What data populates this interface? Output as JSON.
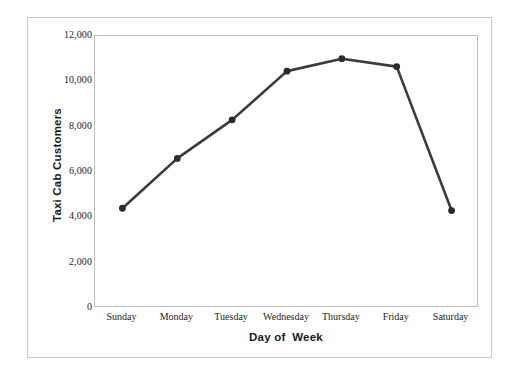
{
  "chart_data": {
    "type": "line",
    "title": "",
    "xlabel": "Day of  Week",
    "ylabel": "Taxi Cab Customers",
    "categories": [
      "Sunday",
      "Monday",
      "Tuesday",
      "Wednesday",
      "Thursday",
      "Friday",
      "Saturday"
    ],
    "values": [
      4400,
      6600,
      8300,
      10450,
      11000,
      10650,
      4300
    ],
    "series": [
      {
        "name": "Taxi Cab Customers",
        "values": [
          4400,
          6600,
          8300,
          10450,
          11000,
          10650,
          4300
        ]
      }
    ],
    "ylim": [
      0,
      12000
    ],
    "y_ticks": [
      0,
      2000,
      4000,
      6000,
      8000,
      10000,
      12000
    ],
    "y_tick_labels": [
      "0",
      "2,000",
      "4,000",
      "6,000",
      "8,000",
      "10,000",
      "12,000"
    ],
    "grid": false,
    "legend": "none",
    "line_color": "#3b3b3b",
    "marker_color": "#2b2b2b",
    "marker_shape": "circle",
    "plot_border_color": "#bdbdbd",
    "frame_border_color": "#c9c9c9",
    "background_color": "#ffffff"
  }
}
